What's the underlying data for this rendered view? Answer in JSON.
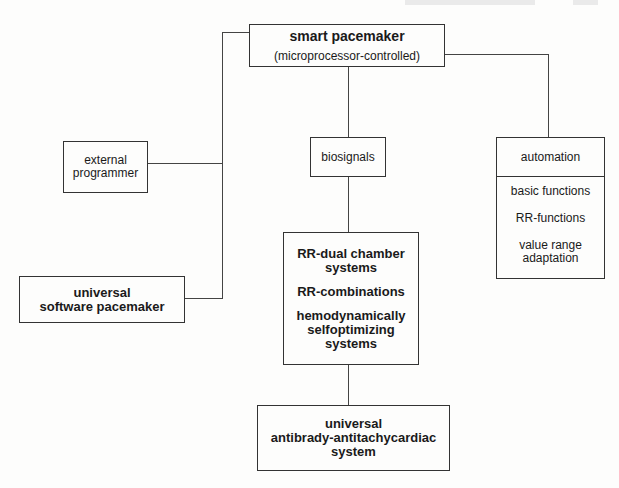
{
  "diagram": {
    "root": {
      "title": "smart pacemaker",
      "subtitle": "(microprocessor-controlled)"
    },
    "left": {
      "external_programmer": [
        "external",
        "programmer"
      ],
      "universal_software_pacemaker": [
        "universal",
        "software pacemaker"
      ]
    },
    "center": {
      "biosignals": "biosignals",
      "rr_box": [
        "RR-dual chamber",
        "systems",
        "RR-combinations",
        "hemodynamically",
        "selfoptimizing",
        "systems"
      ],
      "bottom": [
        "universal",
        "antibrady-antitachycardiac",
        "system"
      ]
    },
    "right": {
      "automation": "automation",
      "items": [
        "basic functions",
        "RR-functions",
        "value range",
        "adaptation"
      ]
    }
  }
}
